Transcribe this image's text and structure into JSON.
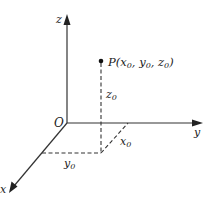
{
  "diagram": {
    "type": "3d-coordinate-system",
    "axes": {
      "x_label": "x",
      "y_label": "y",
      "z_label": "z"
    },
    "origin_label": "O",
    "point": {
      "name": "P",
      "label_prefix": "P(",
      "coords": [
        "x",
        "y",
        "z"
      ],
      "subscript": "0",
      "label_suffix": ")"
    },
    "projection_labels": {
      "x0": "x",
      "y0": "y",
      "z0": "z",
      "subscript": "0"
    }
  }
}
